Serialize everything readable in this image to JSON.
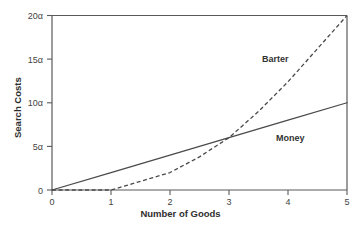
{
  "chart_data": {
    "type": "line",
    "title": "",
    "xlabel": "Number of Goods",
    "ylabel": "Search Costs",
    "xlim": [
      0,
      5
    ],
    "ylim": [
      0,
      20
    ],
    "grid": false,
    "legend_position": "inline-annotations",
    "xticks": [
      {
        "value": 0,
        "label": "0"
      },
      {
        "value": 1,
        "label": "1"
      },
      {
        "value": 2,
        "label": "2"
      },
      {
        "value": 3,
        "label": "3"
      },
      {
        "value": 4,
        "label": "4"
      },
      {
        "value": 5,
        "label": "5"
      }
    ],
    "yticks": [
      {
        "value": 0,
        "label": "0"
      },
      {
        "value": 5,
        "label": "5α"
      },
      {
        "value": 10,
        "label": "10α"
      },
      {
        "value": 15,
        "label": "15α"
      },
      {
        "value": 20,
        "label": "20α"
      }
    ],
    "series": [
      {
        "name": "Money",
        "style": "solid",
        "color": "#4a4a4a",
        "x": [
          0,
          1,
          2,
          3,
          4,
          5
        ],
        "values": [
          0,
          2,
          4,
          6,
          8,
          10
        ]
      },
      {
        "name": "Barter",
        "style": "dashed",
        "color": "#4a4a4a",
        "x": [
          0,
          1,
          1.5,
          2,
          2.5,
          3,
          3.5,
          4,
          4.5,
          5
        ],
        "values": [
          0,
          0,
          1,
          2,
          3.8,
          6,
          9,
          12.4,
          16.2,
          20
        ]
      }
    ],
    "annotations": [
      {
        "text": "Barter",
        "x": 4.0,
        "y": 15.0
      },
      {
        "text": "Money",
        "x": 4.2,
        "y": 5.8
      }
    ]
  },
  "axis": {
    "x_title": "Number of Goods",
    "y_title": "Search Costs"
  },
  "tick_text": {
    "x": [
      "0",
      "1",
      "2",
      "3",
      "4",
      "5"
    ],
    "y": [
      "0",
      "5α",
      "10α",
      "15α",
      "20α"
    ]
  },
  "labels": {
    "barter": "Barter",
    "money": "Money"
  },
  "colors": {
    "axis": "#5a5a5a",
    "line": "#4a4a4a",
    "text": "#3a3a3a",
    "background": "#ffffff"
  }
}
